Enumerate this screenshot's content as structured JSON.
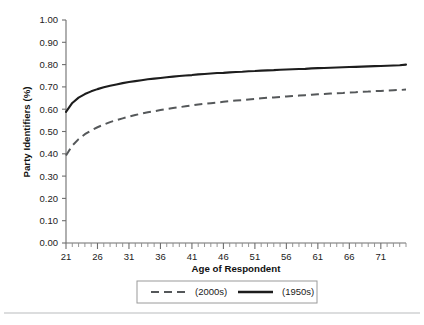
{
  "chart_data": {
    "type": "line",
    "title": "",
    "xlabel": "Age of Respondent",
    "ylabel": "Party Identifiers (%)",
    "xlim": [
      21,
      75
    ],
    "ylim": [
      0.0,
      1.0
    ],
    "grid": false,
    "legend_position": "bottom",
    "x_ticks": [
      21,
      26,
      31,
      36,
      41,
      46,
      51,
      56,
      61,
      66,
      71
    ],
    "x_tick_labels": [
      "21",
      "26",
      "31",
      "36",
      "41",
      "46",
      "51",
      "56",
      "61",
      "66",
      "71"
    ],
    "x_minor_tick_step": 1,
    "y_ticks": [
      0.0,
      0.1,
      0.2,
      0.3,
      0.4,
      0.5,
      0.6,
      0.7,
      0.8,
      0.9,
      1.0
    ],
    "y_tick_labels": [
      "0.00",
      "0.10",
      "0.20",
      "0.30",
      "0.40",
      "0.50",
      "0.60",
      "0.70",
      "0.80",
      "0.90",
      "1.00"
    ],
    "x": [
      21,
      22,
      23,
      24,
      25,
      26,
      27,
      28,
      29,
      30,
      31,
      32,
      33,
      34,
      35,
      36,
      37,
      38,
      39,
      40,
      41,
      42,
      43,
      44,
      45,
      46,
      47,
      48,
      49,
      50,
      51,
      52,
      53,
      54,
      55,
      56,
      57,
      58,
      59,
      60,
      61,
      62,
      63,
      64,
      65,
      66,
      67,
      68,
      69,
      70,
      71,
      72,
      73,
      74,
      75
    ],
    "series": [
      {
        "name": "(2000s)",
        "style": "dashed",
        "color": "#55585a",
        "values": [
          0.392,
          0.437,
          0.466,
          0.488,
          0.505,
          0.519,
          0.531,
          0.542,
          0.551,
          0.559,
          0.567,
          0.574,
          0.58,
          0.586,
          0.591,
          0.596,
          0.601,
          0.605,
          0.609,
          0.613,
          0.617,
          0.621,
          0.624,
          0.627,
          0.63,
          0.633,
          0.636,
          0.639,
          0.641,
          0.644,
          0.646,
          0.649,
          0.651,
          0.653,
          0.655,
          0.657,
          0.659,
          0.661,
          0.663,
          0.665,
          0.667,
          0.668,
          0.67,
          0.672,
          0.673,
          0.675,
          0.676,
          0.678,
          0.679,
          0.681,
          0.682,
          0.684,
          0.685,
          0.686,
          0.688
        ]
      },
      {
        "name": "(1950s)",
        "style": "solid",
        "color": "#1d1d1d",
        "values": [
          0.588,
          0.628,
          0.652,
          0.668,
          0.68,
          0.69,
          0.698,
          0.705,
          0.711,
          0.717,
          0.722,
          0.726,
          0.73,
          0.734,
          0.737,
          0.74,
          0.743,
          0.746,
          0.749,
          0.751,
          0.753,
          0.756,
          0.758,
          0.76,
          0.762,
          0.763,
          0.765,
          0.767,
          0.768,
          0.77,
          0.771,
          0.773,
          0.774,
          0.775,
          0.777,
          0.778,
          0.779,
          0.78,
          0.781,
          0.783,
          0.784,
          0.785,
          0.786,
          0.787,
          0.788,
          0.789,
          0.79,
          0.791,
          0.792,
          0.793,
          0.794,
          0.795,
          0.796,
          0.797,
          0.8
        ]
      }
    ],
    "legend": [
      {
        "label": "(2000s)",
        "style": "dashed"
      },
      {
        "label": "(1950s)",
        "style": "solid"
      }
    ]
  }
}
